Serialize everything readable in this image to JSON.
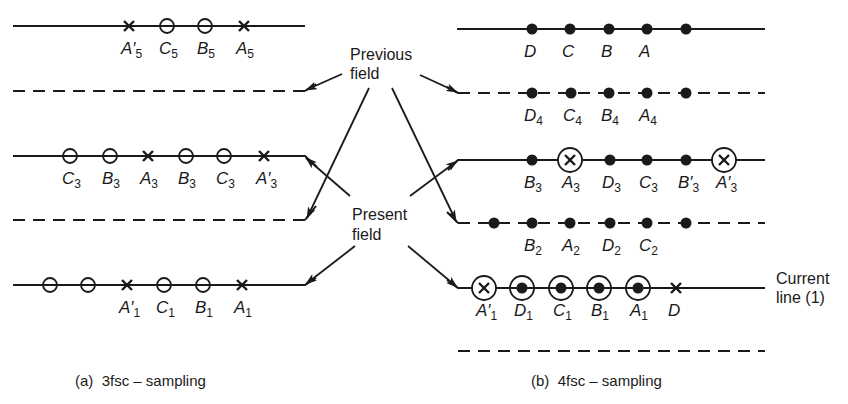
{
  "center_labels": {
    "previous_line1": "Previous",
    "previous_line2": "field",
    "present_line1": "Present",
    "present_line2": "field"
  },
  "left_panel": {
    "caption": "(a)  3fsc – sampling",
    "lines": [
      {
        "y": 26,
        "style": "solid",
        "field": "previous",
        "points": [
          {
            "x": 129,
            "mark": "cross",
            "label": "A",
            "prime": "′",
            "sub": "5"
          },
          {
            "x": 167,
            "mark": "open-circle",
            "label": "C",
            "prime": "",
            "sub": "5"
          },
          {
            "x": 205,
            "mark": "open-circle",
            "label": "B",
            "prime": "",
            "sub": "5"
          },
          {
            "x": 244,
            "mark": "cross",
            "label": "A",
            "prime": "",
            "sub": "5"
          }
        ]
      },
      {
        "y": 91,
        "style": "dashed",
        "field": "present",
        "points": []
      },
      {
        "y": 156,
        "style": "solid",
        "field": "previous",
        "points": [
          {
            "x": 70,
            "mark": "open-circle",
            "label": "C",
            "prime": "",
            "sub": "3"
          },
          {
            "x": 110,
            "mark": "open-circle",
            "label": "B",
            "prime": "",
            "sub": "3"
          },
          {
            "x": 148,
            "mark": "cross",
            "label": "A",
            "prime": "",
            "sub": "3"
          },
          {
            "x": 186,
            "mark": "open-circle",
            "label": "B",
            "prime": "",
            "sub": "3"
          },
          {
            "x": 224,
            "mark": "open-circle",
            "label": "C",
            "prime": "",
            "sub": "3"
          },
          {
            "x": 264,
            "mark": "cross",
            "label": "A",
            "prime": "′",
            "sub": "3"
          }
        ]
      },
      {
        "y": 220,
        "style": "dashed",
        "field": "present",
        "points": []
      },
      {
        "y": 285,
        "style": "solid",
        "field": "previous",
        "points": [
          {
            "x": 50,
            "mark": "open-circle",
            "label": "",
            "prime": "",
            "sub": ""
          },
          {
            "x": 88,
            "mark": "open-circle",
            "label": "",
            "prime": "",
            "sub": ""
          },
          {
            "x": 127,
            "mark": "cross",
            "label": "A",
            "prime": "′",
            "sub": "1"
          },
          {
            "x": 164,
            "mark": "open-circle",
            "label": "C",
            "prime": "",
            "sub": "1"
          },
          {
            "x": 203,
            "mark": "open-circle",
            "label": "B",
            "prime": "",
            "sub": "1"
          },
          {
            "x": 242,
            "mark": "cross",
            "label": "A",
            "prime": "",
            "sub": "1"
          }
        ]
      }
    ]
  },
  "right_panel": {
    "caption": "(b)  4fsc – sampling",
    "current_line_label_1": "Current",
    "current_line_label_2": "line (1)",
    "lines": [
      {
        "y": 29,
        "style": "solid",
        "points": [
          {
            "x": 532,
            "mark": "dot",
            "label": "D",
            "prime": "",
            "sub": ""
          },
          {
            "x": 570,
            "mark": "dot",
            "label": "C",
            "prime": "",
            "sub": ""
          },
          {
            "x": 609,
            "mark": "dot",
            "label": "B",
            "prime": "",
            "sub": ""
          },
          {
            "x": 647,
            "mark": "dot",
            "label": "A",
            "prime": "",
            "sub": ""
          },
          {
            "x": 686,
            "mark": "dot",
            "label": "",
            "prime": "",
            "sub": ""
          }
        ]
      },
      {
        "y": 93,
        "style": "dashed",
        "points": [
          {
            "x": 532,
            "mark": "dot",
            "label": "D",
            "prime": "",
            "sub": "4"
          },
          {
            "x": 571,
            "mark": "dot",
            "label": "C",
            "prime": "",
            "sub": "4"
          },
          {
            "x": 609,
            "mark": "dot",
            "label": "B",
            "prime": "",
            "sub": "4"
          },
          {
            "x": 647,
            "mark": "dot",
            "label": "A",
            "prime": "",
            "sub": "4"
          },
          {
            "x": 686,
            "mark": "dot",
            "label": "",
            "prime": "",
            "sub": ""
          }
        ]
      },
      {
        "y": 160,
        "style": "solid",
        "points": [
          {
            "x": 532,
            "mark": "dot",
            "label": "B",
            "prime": "",
            "sub": "3"
          },
          {
            "x": 570,
            "mark": "circled-cross",
            "label": "A",
            "prime": "",
            "sub": "3"
          },
          {
            "x": 610,
            "mark": "dot",
            "label": "D",
            "prime": "",
            "sub": "3"
          },
          {
            "x": 647,
            "mark": "dot",
            "label": "C",
            "prime": "",
            "sub": "3"
          },
          {
            "x": 686,
            "mark": "dot",
            "label": "B",
            "prime": "′",
            "sub": "3"
          },
          {
            "x": 724,
            "mark": "circled-cross",
            "label": "A",
            "prime": "′",
            "sub": "3"
          }
        ]
      },
      {
        "y": 223,
        "style": "dashed",
        "points": [
          {
            "x": 494,
            "mark": "dot",
            "label": "",
            "prime": "",
            "sub": ""
          },
          {
            "x": 532,
            "mark": "dot",
            "label": "B",
            "prime": "",
            "sub": "2"
          },
          {
            "x": 570,
            "mark": "dot",
            "label": "A",
            "prime": "",
            "sub": "2"
          },
          {
            "x": 610,
            "mark": "dot",
            "label": "D",
            "prime": "",
            "sub": "2"
          },
          {
            "x": 647,
            "mark": "dot",
            "label": "C",
            "prime": "",
            "sub": "2"
          },
          {
            "x": 686,
            "mark": "dot",
            "label": "",
            "prime": "",
            "sub": ""
          }
        ]
      },
      {
        "y": 288,
        "style": "solid",
        "points": [
          {
            "x": 484,
            "mark": "circled-cross",
            "label": "A",
            "prime": "′",
            "sub": "1"
          },
          {
            "x": 522,
            "mark": "circled-dot",
            "label": "D",
            "prime": "",
            "sub": "1"
          },
          {
            "x": 561,
            "mark": "circled-dot",
            "label": "C",
            "prime": "",
            "sub": "1"
          },
          {
            "x": 599,
            "mark": "circled-dot",
            "label": "B",
            "prime": "",
            "sub": "1"
          },
          {
            "x": 638,
            "mark": "circled-dot",
            "label": "A",
            "prime": "",
            "sub": "1"
          },
          {
            "x": 676,
            "mark": "cross",
            "label": "D",
            "prime": "",
            "sub": ""
          }
        ]
      },
      {
        "y": 351,
        "style": "dashed",
        "points": []
      }
    ]
  },
  "colors": {
    "ink": "#1a1a1a",
    "background": "#ffffff"
  }
}
